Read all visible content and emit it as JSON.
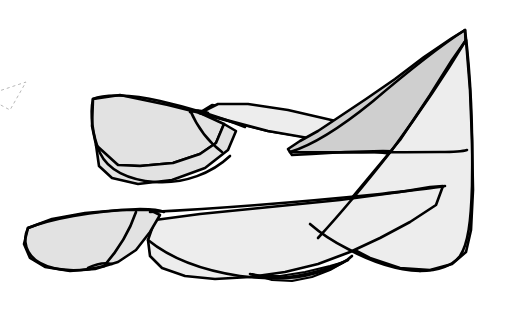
{
  "image": {
    "kind": "vector-line-illustration",
    "subject": "faceted folded ribbon surface",
    "width": 508,
    "height": 313,
    "background_color": "#ffffff",
    "outline_color": "#000000",
    "title": ""
  },
  "palette": {
    "background": "#ffffff",
    "outline": "#000000",
    "fill_light": "#ededed",
    "fill_mid": "#e2e2e2",
    "fill_dark": "#cfcfcf",
    "fill_shadow": "#c6c6c6",
    "construction_line": "#b9b9b9"
  },
  "facets": [
    {
      "name": "upper-left-wing",
      "shade": "fill_mid",
      "points": "93,99 120,95 168,105 200,113 224,124 216,143 200,154 173,163 140,166 118,165 102,158 96,145 92,126"
    },
    {
      "name": "upper-left-wing-lower-lobe",
      "shade": "fill_mid",
      "points": "96,145 118,165 140,166 173,163 200,154 216,143 224,124 236,131 228,150 205,168 172,180 138,184 112,178 99,166"
    },
    {
      "name": "mid-band-left",
      "shade": "fill_light",
      "points": "199,113 232,122 268,131 300,136 337,143 368,151 418,157 424,148 392,139 352,130 310,122 272,115 236,108 212,105"
    },
    {
      "name": "central-upper-panel",
      "shade": "fill_light",
      "points": "200,113 268,131 337,143 418,157 424,148 390,136 340,122 288,110 248,104 218,104"
    },
    {
      "name": "dark-upper-sail",
      "shade": "fill_dark",
      "points": "465,30 452,38 424,57 395,79 366,99 339,117 318,131 300,141 288,149 292,155 312,154 345,152 383,151 420,152 452,152 466,150 467,110 467,70"
    },
    {
      "name": "right-vertical-panel",
      "shade": "fill_light",
      "points": "466,40 470,90 472,140 473,190 471,230 466,252 452,264 430,270 400,268 370,258 345,245 330,232 350,200 375,170 400,140 430,95 452,60"
    },
    {
      "name": "lower-central-band",
      "shade": "fill_light",
      "points": "155,220 200,214 250,209 300,204 340,200 370,196 400,192 430,187 443,186 436,205 410,222 380,238 350,252 318,264 285,272 250,277 215,279 185,276 162,268 150,256 148,240"
    },
    {
      "name": "lower-left-tail",
      "shade": "fill_mid",
      "points": "28,228 52,219 85,213 120,210 150,210 160,215 150,232 136,250 118,262 95,269 70,271 45,267 30,258 24,244"
    },
    {
      "name": "bottom-shadow-lens",
      "shade": "fill_shadow",
      "points": "252,274 272,280 292,281 312,277 330,270 344,262 330,266 305,272 280,276 262,276"
    }
  ],
  "edges": [
    {
      "name": "upper-wing-top-edge",
      "path": "M 93,99 C 104,94 130,94 160,101 C 195,109 225,119 245,127"
    },
    {
      "name": "upper-wing-bottom-edge",
      "path": "M 93,99 C 90,113 92,135 100,153 C 108,170 128,180 155,182 C 185,184 212,173 230,156"
    },
    {
      "name": "wing-fold-crease",
      "path": "M 190,110 C 196,124 206,140 222,152"
    },
    {
      "name": "sail-leading-edge",
      "path": "M 465,30 C 440,46 405,74 372,102 C 340,128 310,146 290,152"
    },
    {
      "name": "sail-trailing-edge",
      "path": "M 290,152 C 330,153 390,152 440,152 C 456,152 464,151 467,150"
    },
    {
      "name": "sail-inner-crease",
      "path": "M 466,40 C 448,70 420,112 392,150"
    },
    {
      "name": "right-outer-contour",
      "path": "M 465,30 C 470,70 473,130 472,186 C 471,222 468,244 460,256 C 452,266 438,271 420,271"
    },
    {
      "name": "right-lower-contour",
      "path": "M 420,271 C 398,270 372,262 348,249 C 330,240 318,231 310,224"
    },
    {
      "name": "mid-diagonal-crease",
      "path": "M 392,150 C 370,178 342,212 318,238"
    },
    {
      "name": "lower-band-top-edge",
      "path": "M 150,212 C 210,209 300,202 380,194 C 415,190 435,188 445,186"
    },
    {
      "name": "lower-band-bottom-edge",
      "path": "M 148,240 C 170,258 200,270 240,276 C 280,282 318,274 348,260"
    },
    {
      "name": "tail-top-edge",
      "path": "M 28,228 C 50,219 90,211 140,209 C 152,209 160,210 164,212"
    },
    {
      "name": "tail-bottom-edge",
      "path": "M 28,228 C 22,241 26,255 40,263 C 56,272 82,272 104,266"
    },
    {
      "name": "tail-crease",
      "path": "M 136,212 C 130,230 118,250 104,266"
    },
    {
      "name": "tail-cusp",
      "path": "M 88,268 C 96,264 104,262 112,264"
    },
    {
      "name": "bottom-lens-edge",
      "path": "M 250,274 C 272,281 300,279 326,270 C 340,265 348,260 352,256"
    },
    {
      "name": "central-notch",
      "path": "M 190,112 C 196,110 202,110 208,113"
    }
  ],
  "construction": [
    {
      "name": "dashed-reference-triangle",
      "path": "M -16,96 L 26,82 L 10,110 Z"
    }
  ],
  "annotations": {
    "labels": [],
    "note": ""
  }
}
